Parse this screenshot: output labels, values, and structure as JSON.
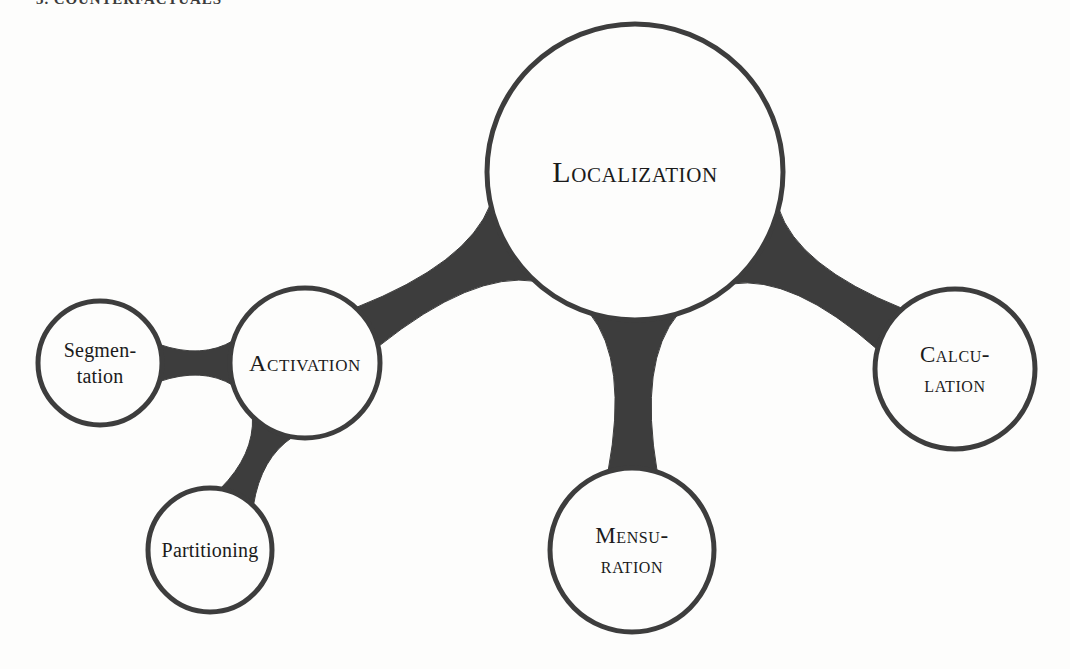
{
  "page": {
    "heading": "3. COUNTERFACTUALS",
    "background_color": "#fdfdfc"
  },
  "style": {
    "stroke_color": "#3d3d3d",
    "connector_color": "#3d3d3d",
    "label_color": "#1b1b1b",
    "node_fill": "#fdfdfc",
    "stroke_width": 5
  },
  "chart_data": {
    "type": "diagram",
    "subtype": "bubble-concept-map",
    "title": "3. COUNTERFACTUALS",
    "node_style": "circle-outline",
    "connector_style": "metaball-blob",
    "nodes": [
      {
        "id": "localization",
        "label": "Localization",
        "lines": [
          "Localization"
        ],
        "case": "small-caps",
        "cx": 635,
        "cy": 172,
        "r": 148,
        "font_size": 30,
        "role": "hub"
      },
      {
        "id": "activation",
        "label": "Activation",
        "lines": [
          "Activation"
        ],
        "case": "small-caps",
        "cx": 305,
        "cy": 363,
        "r": 75,
        "font_size": 24,
        "role": "branch"
      },
      {
        "id": "calculation",
        "label": "Calcu-lation",
        "lines": [
          "Calcu-",
          "lation"
        ],
        "case": "small-caps",
        "cx": 955,
        "cy": 369,
        "r": 80,
        "font_size": 23,
        "role": "branch"
      },
      {
        "id": "mensuration",
        "label": "Mensu-ration",
        "lines": [
          "Mensu-",
          "ration"
        ],
        "case": "small-caps",
        "cx": 632,
        "cy": 550,
        "r": 82,
        "font_size": 23,
        "role": "branch"
      },
      {
        "id": "segmentation",
        "label": "Segmen-tation",
        "lines": [
          "Segmen-",
          "tation"
        ],
        "case": "lowercase",
        "cx": 100,
        "cy": 363,
        "r": 62,
        "font_size": 20,
        "role": "leaf"
      },
      {
        "id": "partitioning",
        "label": "Partitioning",
        "lines": [
          "Partitioning"
        ],
        "case": "lowercase",
        "cx": 210,
        "cy": 550,
        "r": 62,
        "font_size": 20,
        "role": "leaf"
      }
    ],
    "edges": [
      {
        "id": "edge-localization-activation",
        "from": "localization",
        "to": "activation"
      },
      {
        "id": "edge-localization-calculation",
        "from": "localization",
        "to": "calculation"
      },
      {
        "id": "edge-localization-mensuration",
        "from": "localization",
        "to": "mensuration"
      },
      {
        "id": "edge-activation-segmentation",
        "from": "activation",
        "to": "segmentation"
      },
      {
        "id": "edge-activation-partitioning",
        "from": "activation",
        "to": "partitioning"
      }
    ]
  }
}
